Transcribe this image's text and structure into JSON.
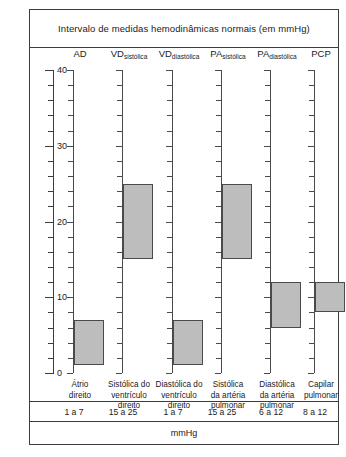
{
  "figure": {
    "title": "Intervalo de medidas hemodinâmicas normais (em mmHg)",
    "axis_title_left": "mmHg",
    "axis_title_bottom": "mmHg"
  },
  "chart_data": {
    "type": "bar",
    "title": "Intervalo de medidas hemodinâmicas normais (em mmHg)",
    "xlabel": "mmHg",
    "ylabel": "mmHg",
    "ylim": [
      0,
      40
    ],
    "grid": false,
    "legend": "none",
    "orientation": "vertical-range-bars",
    "y_ticks_major": [
      0,
      10,
      20,
      30,
      40
    ],
    "y_tick_labels": [
      "0",
      "10",
      "20",
      "30",
      "40"
    ],
    "y_tick_minor_step": 2,
    "bar_fill_color": "#bdbdbd",
    "bar_border_color": "#4a4a4a",
    "categories": [
      {
        "key": "AD",
        "header_main": "AD",
        "header_sub": "",
        "description": "Átrio\ndireito",
        "low": 1,
        "high": 7,
        "range_label": "1 a 7"
      },
      {
        "key": "VD_sistolica",
        "header_main": "VD",
        "header_sub": "sistólica",
        "description": "Sistólica do\nventrículo\ndireito",
        "low": 15,
        "high": 25,
        "range_label": "15 a 25"
      },
      {
        "key": "VD_diastolica",
        "header_main": "VD",
        "header_sub": "diastólica",
        "description": "Diastólica do\nventrículo\ndireito",
        "low": 1,
        "high": 7,
        "range_label": "1 a 7"
      },
      {
        "key": "PA_sistolica",
        "header_main": "PA",
        "header_sub": "sistólica",
        "description": "Sistólica\nda artéria\npulmonar",
        "low": 15,
        "high": 25,
        "range_label": "15 a 25"
      },
      {
        "key": "PA_diastolica",
        "header_main": "PA",
        "header_sub": "diastólica",
        "description": "Diastólica\nda artéria\npulmonar",
        "low": 6,
        "high": 12,
        "range_label": "6 a 12"
      },
      {
        "key": "PCP",
        "header_main": "PCP",
        "header_sub": "",
        "description": "Capilar\npulmonar",
        "low": 8,
        "high": 12,
        "range_label": "8 a 12"
      }
    ]
  }
}
